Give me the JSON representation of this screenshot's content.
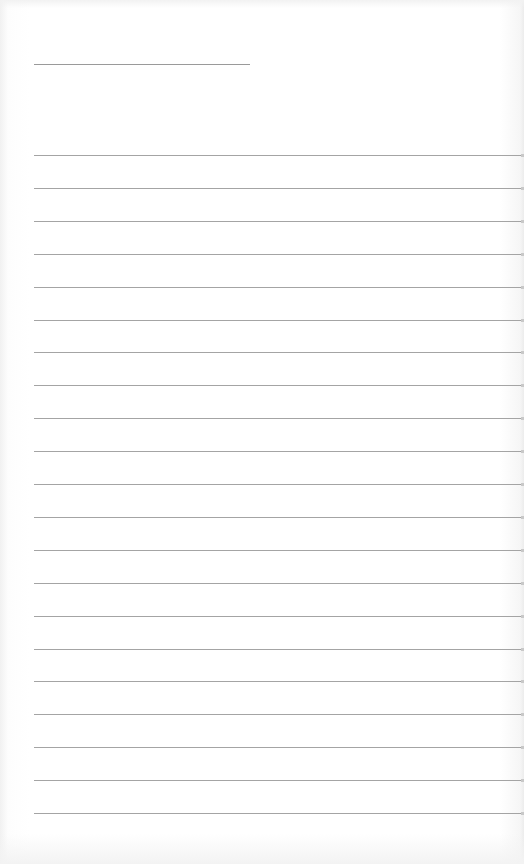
{
  "page": {
    "type": "lined-paper",
    "background": "#ffffff",
    "line_color": "#a4a4a4",
    "title_line": {
      "top": 64,
      "left": 34,
      "width": 216
    },
    "rules": {
      "count": 21,
      "first_top": 155,
      "spacing": 32.9,
      "left": 34
    }
  }
}
